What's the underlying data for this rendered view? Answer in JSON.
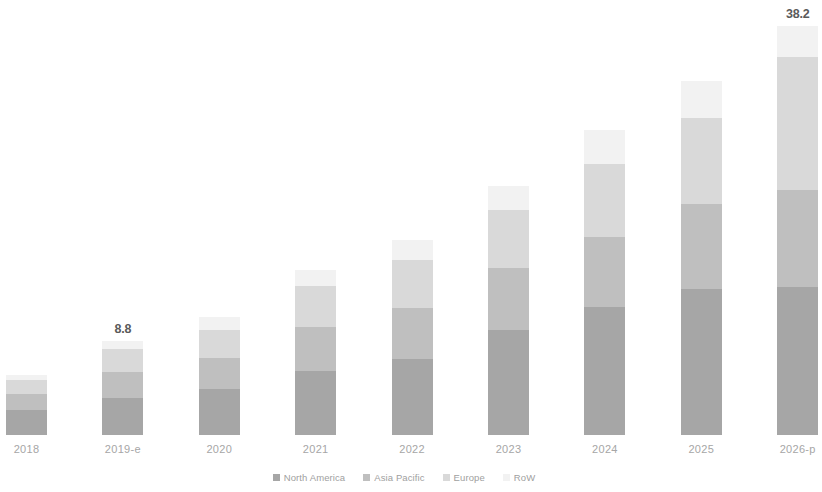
{
  "chart_data": {
    "type": "bar",
    "subtype": "stacked-bar",
    "title": "",
    "subtitle": "",
    "xlabel": "",
    "ylabel": "",
    "grid": false,
    "legend_position": "bottom",
    "axis_visible": false,
    "ylim": [
      0,
      40
    ],
    "categories": [
      "2018",
      "2019-e",
      "2020",
      "2021",
      "2022",
      "2023",
      "2024",
      "2025",
      "2026-p"
    ],
    "totals": [
      5.6,
      8.8,
      11.0,
      15.4,
      18.2,
      23.3,
      28.5,
      33.1,
      38.2
    ],
    "data_labels": [
      {
        "category": "2019-e",
        "value": "8.8"
      },
      {
        "category": "2026-p",
        "value": "38.2"
      }
    ],
    "series": [
      {
        "name": "North America",
        "color": "#a6a6a6",
        "values": [
          2.3,
          3.5,
          4.3,
          6.0,
          7.1,
          9.8,
          12.0,
          13.6,
          13.8
        ]
      },
      {
        "name": "Asia Pacific",
        "color": "#bfbfbf",
        "values": [
          1.5,
          2.4,
          2.9,
          4.1,
          4.8,
          5.8,
          6.5,
          8.0,
          9.1
        ]
      },
      {
        "name": "Europe",
        "color": "#d9d9d9",
        "values": [
          1.3,
          2.1,
          2.6,
          3.8,
          4.5,
          5.4,
          6.8,
          8.0,
          12.4
        ]
      },
      {
        "name": "RoW",
        "color": "#f2f2f2",
        "values": [
          0.5,
          0.8,
          1.2,
          1.5,
          1.8,
          2.3,
          3.2,
          3.5,
          2.9
        ]
      }
    ]
  },
  "legend": {
    "items": [
      {
        "label": "North America",
        "color": "#a6a6a6",
        "icon": "square-swatch-icon"
      },
      {
        "label": "Asia Pacific",
        "color": "#bfbfbf",
        "icon": "square-swatch-icon"
      },
      {
        "label": "Europe",
        "color": "#d9d9d9",
        "icon": "square-swatch-icon"
      },
      {
        "label": "RoW",
        "color": "#f2f2f2",
        "icon": "square-swatch-icon"
      }
    ]
  },
  "layout": {
    "baseline_y": 435,
    "bar_width": 41,
    "first_bar_x": 6,
    "bar_pitch": 96.4,
    "px_per_unit": 10.7
  }
}
